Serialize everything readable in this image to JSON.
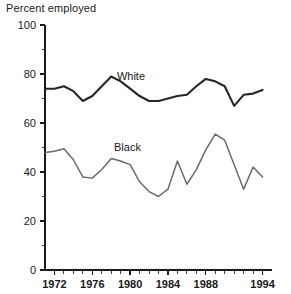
{
  "chart_data": {
    "type": "line",
    "title": "Percent employed",
    "xlabel": "",
    "ylabel": "",
    "ylim": [
      0,
      100
    ],
    "xlim": [
      1971,
      1995
    ],
    "grid": false,
    "legend_position": "inline-annotation",
    "y_ticks": [
      "0",
      "20",
      "40",
      "60",
      "80",
      "100"
    ],
    "y_tick_values": [
      0,
      20,
      40,
      60,
      80,
      100
    ],
    "y_minor_step": 10,
    "x_ticks": [
      "1972",
      "1976",
      "1980",
      "1984",
      "1988",
      "1994"
    ],
    "x_tick_values": [
      1972,
      1976,
      1980,
      1984,
      1988,
      1994
    ],
    "x_minor_step": 1,
    "x": [
      1971,
      1972,
      1973,
      1974,
      1975,
      1976,
      1977,
      1978,
      1979,
      1980,
      1981,
      1982,
      1983,
      1984,
      1985,
      1986,
      1987,
      1988,
      1989,
      1990,
      1991,
      1992,
      1993,
      1994
    ],
    "series": [
      {
        "name": "White",
        "label": "White",
        "color": "#262626",
        "values": [
          74,
          74,
          75,
          73,
          69,
          71,
          75,
          79,
          77,
          74,
          71,
          69,
          69,
          70,
          71,
          71.5,
          75,
          78,
          77,
          75,
          67,
          71.5,
          72,
          73.5
        ]
      },
      {
        "name": "Black",
        "label": "Black",
        "color": "#6b6b6b",
        "values": [
          48,
          48.5,
          49.5,
          45,
          38,
          37.5,
          41,
          45.5,
          44.5,
          43,
          36,
          32,
          30,
          33,
          44.5,
          35,
          41,
          49,
          55.5,
          53,
          43,
          33,
          42,
          38
        ]
      }
    ],
    "annotations": [
      {
        "text": "White",
        "x": 1978.6,
        "y": 77.5
      },
      {
        "text": "Black",
        "x": 1978.3,
        "y": 48.5
      }
    ]
  }
}
